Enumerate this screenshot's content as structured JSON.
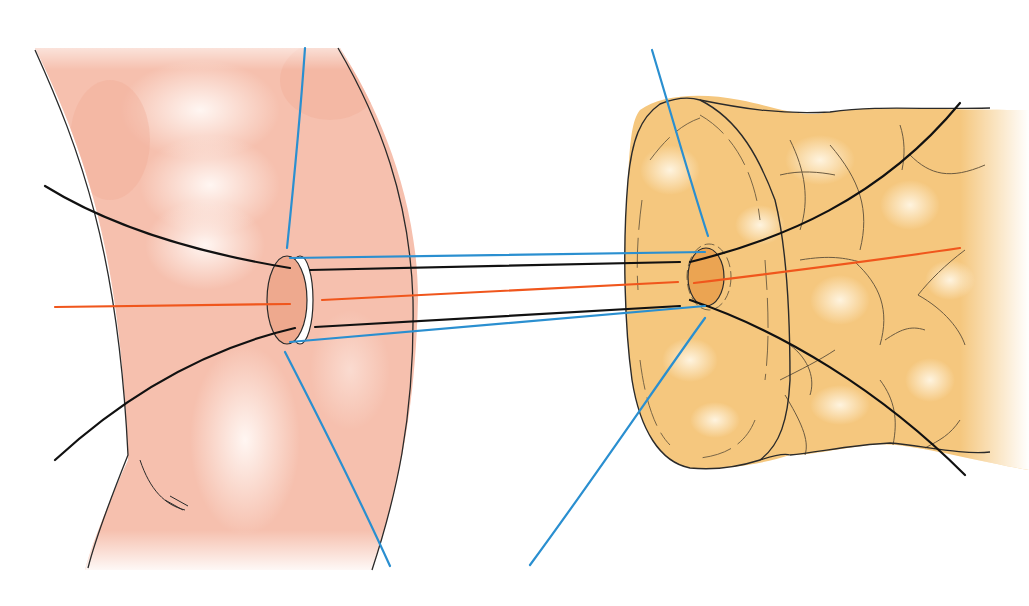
{
  "figure": {
    "title": "Duct-to-mucosa anastomosis with interrupted sutures",
    "width": 1029,
    "height": 606
  },
  "colors": {
    "background": "#ffffff",
    "intestine_fill": "#f6c0ae",
    "intestine_highlight": "#fff2ec",
    "intestine_opening": "#eea98e",
    "pancreas_fill": "#f5c77e",
    "pancreas_highlight": "#fdf0d6",
    "pancreas_duct": "#eba452",
    "outline": "#2a2a2a",
    "suture_black": "#111111",
    "suture_blue": "#2a8fd0",
    "suture_orange": "#f0561c"
  },
  "parts": {
    "intestine": {
      "label": "jejunum",
      "opening_center": [
        287,
        300
      ]
    },
    "pancreas": {
      "label": "pancreatic stump",
      "duct_center": [
        706,
        277
      ]
    }
  },
  "sutures": [
    {
      "id": "blue-upper",
      "color": "suture_blue",
      "label": "seromuscular suture (upper)"
    },
    {
      "id": "black-upper",
      "color": "suture_black",
      "label": "duct-to-mucosa suture (upper)"
    },
    {
      "id": "orange-mid",
      "color": "suture_orange",
      "label": "stent / central suture"
    },
    {
      "id": "black-lower",
      "color": "suture_black",
      "label": "duct-to-mucosa suture (lower)"
    },
    {
      "id": "blue-lower",
      "color": "suture_blue",
      "label": "seromuscular suture (lower)"
    }
  ]
}
